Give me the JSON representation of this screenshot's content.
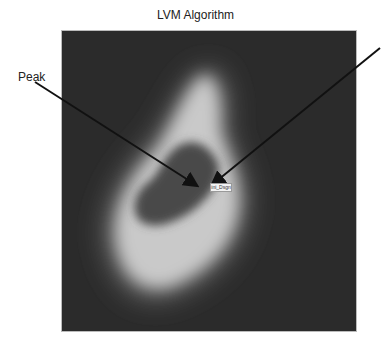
{
  "figure": {
    "title": "LVM Algorithm",
    "annotations": [
      {
        "label": "Peak",
        "arrow_from": [
          35,
          82
        ],
        "arrow_to": [
          196,
          185
        ]
      },
      {
        "label": "",
        "arrow_from": [
          380,
          48
        ],
        "arrow_to": [
          213,
          184
        ]
      }
    ],
    "marker_tag": "ini_Dsgn",
    "colors": {
      "background": "#2b2b2b",
      "ring": "#c8c8c8",
      "core": "#4a4a4a",
      "arrow": "#111111"
    }
  }
}
